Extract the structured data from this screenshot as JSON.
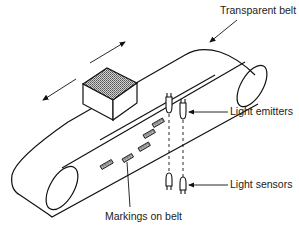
{
  "diagram": {
    "labels": {
      "transparent_belt": "Transparent belt",
      "light_emitters": "Light emitters",
      "light_sensors": "Light sensors",
      "markings_on_belt": "Markings on belt"
    },
    "components": [
      "transparent-belt",
      "left-roller",
      "right-roller",
      "box-on-belt",
      "motion-arrow",
      "belt-markings",
      "light-emitters",
      "light-sensors"
    ],
    "marking_count": 5,
    "emitter_count": 2,
    "sensor_count": 2,
    "colors": {
      "line": "#111111",
      "box_top_fill": "#9a9a9a",
      "background": "#ffffff"
    }
  }
}
